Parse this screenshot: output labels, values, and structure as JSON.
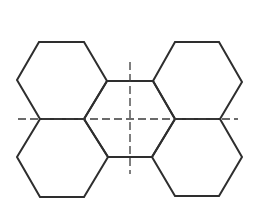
{
  "diagram": {
    "stroke_color": "#2e2e2e",
    "axis_color": "#3a3a3a",
    "background": "#ffffff",
    "hexagons": [
      {
        "id": "top-left",
        "points": "39,42 84,42 107,81 84,119 40,119 17,80"
      },
      {
        "id": "top-right",
        "points": "175,42 219,42 242,82 220,119 175,119 153,81"
      },
      {
        "id": "bottom-left",
        "points": "40,119 84,119 108,157 84,197 40,197 17,157"
      },
      {
        "id": "bottom-right",
        "points": "175,119 220,119 242,157 219,196 175,196 152,157"
      },
      {
        "id": "center",
        "points": "107,81 153,81 175,119 152,157 108,157 84,119"
      }
    ],
    "axes": {
      "horizontal": {
        "x1": 18,
        "y1": 119,
        "x2": 238,
        "y2": 119
      },
      "vertical": {
        "x1": 130,
        "y1": 62,
        "x2": 130,
        "y2": 174
      },
      "dash": "8 4"
    }
  }
}
